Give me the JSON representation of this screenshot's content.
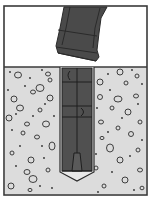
{
  "figure": {
    "colors": {
      "background": "#ffffff",
      "frame": "#3a3a3a",
      "concrete": "#dcdcdc",
      "aggregate_stroke": "#2e2e2e",
      "tool": "#4a4a4a",
      "tool_edge": "#2a2a2a",
      "anchor": "#505050",
      "anchor_edge": "#1e1e1e",
      "hole_outline": "#2a2a2a"
    },
    "parts": [
      {
        "id": "setting-tool",
        "label": "Setting tool"
      },
      {
        "id": "anchor-body",
        "label": "Anchor body"
      },
      {
        "id": "expansion-plug",
        "label": "Expansion plug"
      },
      {
        "id": "drilled-hole",
        "label": "Drilled hole"
      },
      {
        "id": "concrete-base",
        "label": "Concrete"
      }
    ]
  }
}
